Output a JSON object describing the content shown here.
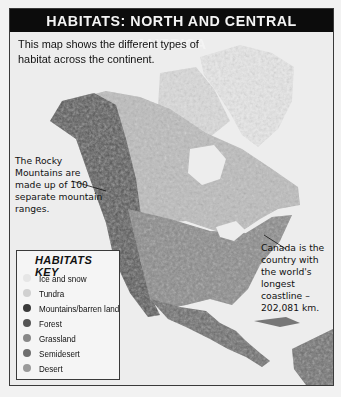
{
  "title": "HABITATS: NORTH AND CENTRAL AMERICA",
  "intro": "This map shows the different types of habitat across the continent.",
  "callouts": {
    "rocky": "The Rocky Mountains are made up of 100 separate mountain ranges.",
    "canada": "Canada is the country with the world's longest coastline – 202,081 km."
  },
  "key": {
    "title": "HABITATS KEY",
    "items": [
      {
        "label": "Ice and snow",
        "icon": "ice-snow-swatch",
        "color": "#e6e6e6"
      },
      {
        "label": "Tundra",
        "icon": "tundra-swatch",
        "color": "#d0d0d0"
      },
      {
        "label": "Mountains/barren land",
        "icon": "mountains-swatch",
        "color": "#3a3a3a"
      },
      {
        "label": "Forest",
        "icon": "forest-swatch",
        "color": "#555555"
      },
      {
        "label": "Grassland",
        "icon": "grassland-swatch",
        "color": "#888888"
      },
      {
        "label": "Semidesert",
        "icon": "semidesert-swatch",
        "color": "#6e6e6e"
      },
      {
        "label": "Desert",
        "icon": "desert-swatch",
        "color": "#9a9a9a"
      }
    ]
  },
  "colors": {
    "title_bg": "#0c0c0c",
    "title_fg": "#f4f4f4",
    "background": "#ededed"
  }
}
